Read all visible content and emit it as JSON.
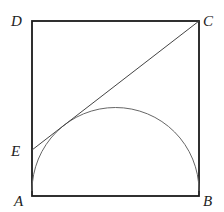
{
  "diagram": {
    "type": "geometry",
    "labels": {
      "A": "A",
      "B": "B",
      "C": "C",
      "D": "D",
      "E": "E"
    },
    "colors": {
      "square_stroke": "#1a1a1a",
      "line_stroke": "#444444",
      "arc_stroke": "#666666",
      "label": "#222222"
    }
  }
}
